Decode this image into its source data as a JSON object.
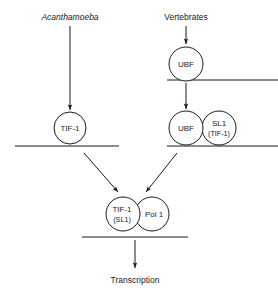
{
  "diagram": {
    "colors": {
      "stroke": "#1a1a1a",
      "background": "#ffffff",
      "node_fill": "#ffffff"
    },
    "headings": [
      {
        "id": "acanthamoeba",
        "text": "Acanthamoeba",
        "style": "italic",
        "x": 70,
        "y": 18
      },
      {
        "id": "vertebrates",
        "text": "Vertebrates",
        "style": "normal",
        "x": 186,
        "y": 18
      }
    ],
    "nodes": [
      {
        "id": "ubf-top",
        "line1": "UBF",
        "line2": "",
        "cx": 186,
        "cy": 64,
        "r": 17
      },
      {
        "id": "tif1-left",
        "line1": "TIF-1",
        "line2": "",
        "cx": 70,
        "cy": 128,
        "r": 16
      },
      {
        "id": "ubf-bottom",
        "line1": "UBF",
        "line2": "",
        "cx": 186,
        "cy": 128,
        "r": 17
      },
      {
        "id": "sl1-tif1",
        "line1": "SL1",
        "line2": "(TIF-1)",
        "cx": 219,
        "cy": 128,
        "r": 17
      },
      {
        "id": "tif1-sl1",
        "line1": "TIF-1",
        "line2": "(SL1)",
        "cx": 123,
        "cy": 214,
        "r": 17
      },
      {
        "id": "pol1",
        "line1": "Pol 1",
        "line2": "",
        "cx": 152,
        "cy": 214,
        "r": 17
      }
    ],
    "dna_lines": [
      {
        "id": "dna-vert-top",
        "x1": 167,
        "y1": 80,
        "x2": 278,
        "y2": 80
      },
      {
        "id": "dna-acanth",
        "x1": 15,
        "y1": 146,
        "x2": 119,
        "y2": 146
      },
      {
        "id": "dna-vert-bottom",
        "x1": 167,
        "y1": 146,
        "x2": 278,
        "y2": 146
      },
      {
        "id": "dna-preinit",
        "x1": 82,
        "y1": 237,
        "x2": 188,
        "y2": 237
      }
    ],
    "arrows": [
      {
        "id": "arrow-acanthamoeba-to-tif1",
        "x1": 70,
        "y1": 26,
        "x2": 70,
        "y2": 110
      },
      {
        "id": "arrow-vertebrates-to-ubf",
        "x1": 186,
        "y1": 26,
        "x2": 186,
        "y2": 44
      },
      {
        "id": "arrow-ubf-to-ubfsl1",
        "x1": 186,
        "y1": 83,
        "x2": 186,
        "y2": 109
      },
      {
        "id": "arrow-left-to-complex",
        "x1": 84,
        "y1": 153,
        "x2": 118,
        "y2": 192
      },
      {
        "id": "arrow-right-to-complex",
        "x1": 177,
        "y1": 153,
        "x2": 146,
        "y2": 192
      },
      {
        "id": "arrow-complex-to-transcription",
        "x1": 135,
        "y1": 240,
        "x2": 135,
        "y2": 268
      }
    ],
    "footer": {
      "id": "transcription",
      "text": "Transcription",
      "x": 135,
      "y": 280
    }
  }
}
